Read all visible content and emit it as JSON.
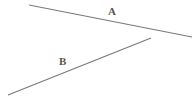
{
  "diagram": {
    "lines": [
      {
        "id": "A",
        "label": "A",
        "x1": 29,
        "y1": 5,
        "x2": 192,
        "y2": 37,
        "label_x": 108,
        "label_y": 15
      },
      {
        "id": "B",
        "label": "B",
        "x1": 8,
        "y1": 95,
        "x2": 151,
        "y2": 38,
        "label_x": 59,
        "label_y": 65
      }
    ],
    "stroke_color": "#7a7a7a",
    "label_color": "#555555"
  }
}
